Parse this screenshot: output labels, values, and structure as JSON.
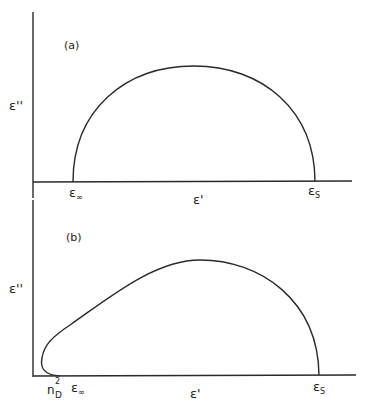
{
  "figure": {
    "panels": [
      {
        "id": "a",
        "label": "(a)",
        "y_axis_label": "ε''",
        "x_axis_label": "ε'",
        "points": [
          {
            "name": "eps-infinity",
            "main": "ε",
            "sub": "∞"
          },
          {
            "name": "eps-static",
            "main": "ε",
            "sub": "S"
          }
        ],
        "curve": "semicircle (Debye / Cole-Cole arc) from ε∞ to εs"
      },
      {
        "id": "b",
        "label": "(b)",
        "y_axis_label": "ε''",
        "x_axis_label": "ε'",
        "points": [
          {
            "name": "n-d-squared",
            "main": "n",
            "sup": "2",
            "sub": "D"
          },
          {
            "name": "eps-infinity",
            "main": "ε",
            "sub": "∞"
          },
          {
            "name": "eps-static",
            "main": "ε",
            "sub": "S"
          }
        ],
        "curve": "skewed arc from n_D² looping through ε∞ region, peak, down to εs"
      }
    ],
    "colors": {
      "line": "#2a2a2a",
      "background": "#ffffff"
    }
  }
}
